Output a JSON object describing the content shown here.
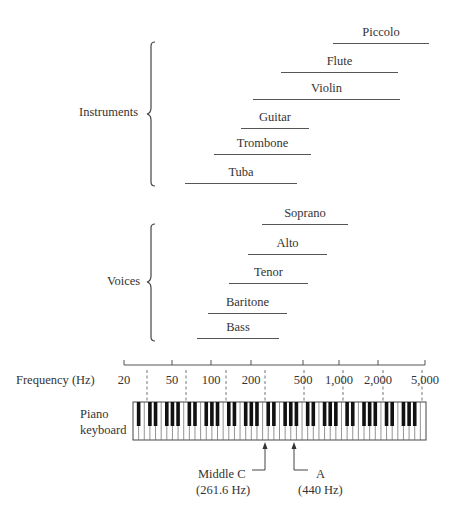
{
  "groups": {
    "instruments": {
      "label": "Instruments",
      "items": [
        {
          "name": "Piccolo",
          "x1": 333,
          "x2": 429,
          "y": 43
        },
        {
          "name": "Flute",
          "x1": 281,
          "x2": 398,
          "y": 72
        },
        {
          "name": "Violin",
          "x1": 253,
          "x2": 400,
          "y": 99
        },
        {
          "name": "Guitar",
          "x1": 241,
          "x2": 309,
          "y": 128
        },
        {
          "name": "Trombone",
          "x1": 214,
          "x2": 311,
          "y": 154
        },
        {
          "name": "Tuba",
          "x1": 185,
          "x2": 297,
          "y": 183
        }
      ]
    },
    "voices": {
      "label": "Voices",
      "items": [
        {
          "name": "Soprano",
          "x1": 262,
          "x2": 348,
          "y": 224
        },
        {
          "name": "Alto",
          "x1": 248,
          "x2": 327,
          "y": 254
        },
        {
          "name": "Tenor",
          "x1": 229,
          "x2": 308,
          "y": 283
        },
        {
          "name": "Baritone",
          "x1": 208,
          "x2": 287,
          "y": 313
        },
        {
          "name": "Bass",
          "x1": 197,
          "x2": 279,
          "y": 338
        }
      ]
    }
  },
  "axis": {
    "label": "Frequency (Hz)",
    "ticks": [
      {
        "label": "20",
        "x": 124
      },
      {
        "label": "50",
        "x": 172
      },
      {
        "label": "100",
        "x": 211
      },
      {
        "label": "200",
        "x": 251
      },
      {
        "label": "500",
        "x": 303
      },
      {
        "label": "1,000",
        "x": 339
      },
      {
        "label": "2,000",
        "x": 378
      },
      {
        "label": "5,000",
        "x": 425
      }
    ],
    "dashed_x": [
      147,
      186,
      226,
      265,
      304,
      343,
      383,
      422
    ]
  },
  "keyboard": {
    "label_line1": "Piano",
    "label_line2": "keyboard",
    "white_keys": 52
  },
  "annotations": {
    "middle_c": {
      "label": "Middle C",
      "freq": "(261.6 Hz)"
    },
    "a440": {
      "label": "A",
      "freq": "(440 Hz)"
    }
  },
  "chart_data": {
    "type": "range",
    "title": "",
    "xlabel": "Frequency (Hz)",
    "xscale": "log",
    "xlim": [
      20,
      5000
    ],
    "x_ticks": [
      "20",
      "50",
      "100",
      "200",
      "500",
      "1,000",
      "2,000",
      "5,000"
    ],
    "series": [
      {
        "group": "Instruments",
        "name": "Piccolo",
        "range_hz": [
          587,
          4186
        ]
      },
      {
        "group": "Instruments",
        "name": "Flute",
        "range_hz": [
          262,
          2093
        ]
      },
      {
        "group": "Instruments",
        "name": "Violin",
        "range_hz": [
          196,
          2200
        ]
      },
      {
        "group": "Instruments",
        "name": "Guitar",
        "range_hz": [
          82,
          880
        ]
      },
      {
        "group": "Instruments",
        "name": "Trombone",
        "range_hz": [
          82,
          520
        ]
      },
      {
        "group": "Instruments",
        "name": "Tuba",
        "range_hz": [
          41,
          350
        ]
      },
      {
        "group": "Voices",
        "name": "Soprano",
        "range_hz": [
          250,
          1050
        ]
      },
      {
        "group": "Voices",
        "name": "Alto",
        "range_hz": [
          175,
          700
        ]
      },
      {
        "group": "Voices",
        "name": "Tenor",
        "range_hz": [
          130,
          500
        ]
      },
      {
        "group": "Voices",
        "name": "Baritone",
        "range_hz": [
          100,
          390
        ]
      },
      {
        "group": "Voices",
        "name": "Bass",
        "range_hz": [
          80,
          330
        ]
      }
    ],
    "annotations": [
      {
        "label": "Middle C",
        "value_hz": 261.6
      },
      {
        "label": "A",
        "value_hz": 440
      }
    ]
  }
}
